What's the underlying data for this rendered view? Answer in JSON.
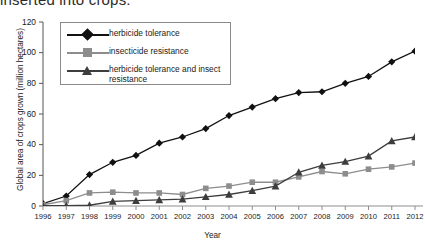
{
  "cut_off_title": "inserted into crops.",
  "axes": {
    "xlabel": "Year",
    "ylabel": "Global area of crops grown (million hectares)",
    "yticks": [
      "0",
      "20",
      "40",
      "60",
      "80",
      "100",
      "120"
    ],
    "xticks": [
      "1996",
      "1997",
      "1998",
      "1999",
      "2000",
      "2001",
      "2002",
      "2003",
      "2004",
      "2005",
      "2006",
      "2007",
      "2008",
      "2009",
      "2010",
      "2011",
      "2012"
    ]
  },
  "legend": {
    "items": [
      {
        "label": "herbicide tolerance",
        "marker": "diamond-marker",
        "color": "#111111"
      },
      {
        "label": "insecticide resistance",
        "marker": "square-marker",
        "color": "#8d8d8d"
      },
      {
        "label": "herbicide tolerance and insect resistance",
        "marker": "triangle-marker",
        "color": "#3d3d3d"
      }
    ]
  },
  "chart_data": {
    "type": "line",
    "title": "",
    "xlabel": "Year",
    "ylabel": "Global area of crops grown (million hectares)",
    "x": [
      1996,
      1997,
      1998,
      1999,
      2000,
      2001,
      2002,
      2003,
      2004,
      2005,
      2006,
      2007,
      2008,
      2009,
      2010,
      2011,
      2012
    ],
    "xlim": [
      1996,
      2012
    ],
    "ylim": [
      0,
      120
    ],
    "yticks": [
      0,
      20,
      40,
      60,
      80,
      100,
      120
    ],
    "grid": false,
    "legend_position": "top-left",
    "series": [
      {
        "name": "herbicide tolerance",
        "marker": "diamond",
        "color": "#111111",
        "values": [
          1.5,
          6.5,
          20.5,
          28.5,
          33,
          41,
          45,
          50.5,
          59,
          64.5,
          70,
          74,
          74.5,
          80,
          84.5,
          94,
          101
        ]
      },
      {
        "name": "insecticide resistance",
        "marker": "square",
        "color": "#8d8d8d",
        "values": [
          0.8,
          3.5,
          8.5,
          9,
          8.5,
          8.5,
          7.5,
          11.5,
          13,
          15.5,
          15.5,
          19,
          22.5,
          21,
          24,
          25.5,
          28
        ]
      },
      {
        "name": "herbicide tolerance and insect resistance",
        "marker": "triangle",
        "color": "#3d3d3d",
        "values": [
          0.2,
          0.3,
          0.5,
          3,
          3.5,
          4,
          4.5,
          6,
          7.5,
          10,
          13,
          22,
          26.5,
          29,
          32.5,
          42.5,
          45
        ]
      }
    ]
  }
}
